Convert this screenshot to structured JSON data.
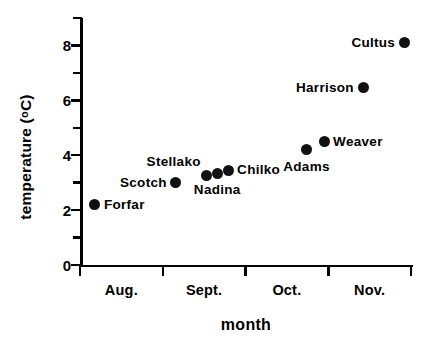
{
  "chart_data": {
    "type": "scatter",
    "title": "",
    "xlabel": "month",
    "ylabel": "temperature ( °C)",
    "ylabel_parts": {
      "main": "temperature  (",
      "degree": "o",
      "unit": "C)"
    },
    "xlim": [
      0,
      4
    ],
    "ylim": [
      0,
      9
    ],
    "grid": false,
    "legend": "none",
    "y_ticks_major": [
      {
        "value": 0,
        "label": "0"
      },
      {
        "value": 2,
        "label": "2"
      },
      {
        "value": 4,
        "label": "4"
      },
      {
        "value": 6,
        "label": "6"
      },
      {
        "value": 8,
        "label": "8"
      }
    ],
    "y_ticks_minor": [
      1,
      3,
      5,
      7,
      9
    ],
    "x_tick_positions": [
      0,
      1,
      2,
      3,
      4
    ],
    "x_tick_labels": [
      "Aug.",
      "Sept.",
      "Oct.",
      "Nov."
    ],
    "point_labels": [
      "Forfar",
      "Scotch",
      "Stellako",
      "Nadina",
      "Chilko",
      "Adams",
      "Weaver",
      "Harrison",
      "Cultus"
    ],
    "points": [
      {
        "name": "Forfar",
        "x": 0.18,
        "y": 2.2,
        "label": "Forfar",
        "label_side": "right"
      },
      {
        "name": "Scotch",
        "x": 1.16,
        "y": 3.0,
        "label": "Scotch",
        "label_side": "left"
      },
      {
        "name": "Stellako",
        "x": 1.53,
        "y": 3.25,
        "label": "Stellako",
        "label_side": "above-left"
      },
      {
        "name": "Nadina",
        "x": 1.66,
        "y": 3.35,
        "label": "Nadina",
        "label_side": "below"
      },
      {
        "name": "Chilko",
        "x": 1.79,
        "y": 3.45,
        "label": "Chilko",
        "label_side": "right"
      },
      {
        "name": "Adams",
        "x": 2.74,
        "y": 4.2,
        "label": "Adams",
        "label_side": "below"
      },
      {
        "name": "Weaver",
        "x": 2.95,
        "y": 4.5,
        "label": "Weaver",
        "label_side": "right"
      },
      {
        "name": "Harrison",
        "x": 3.42,
        "y": 6.45,
        "label": "Harrison",
        "label_side": "left"
      },
      {
        "name": "Cultus",
        "x": 3.92,
        "y": 8.1,
        "label": "Cultus",
        "label_side": "left"
      }
    ],
    "marker": {
      "shape": "circle",
      "color": "#111111",
      "size_px": 11
    },
    "axis_color": "#000000",
    "background": "#ffffff"
  }
}
